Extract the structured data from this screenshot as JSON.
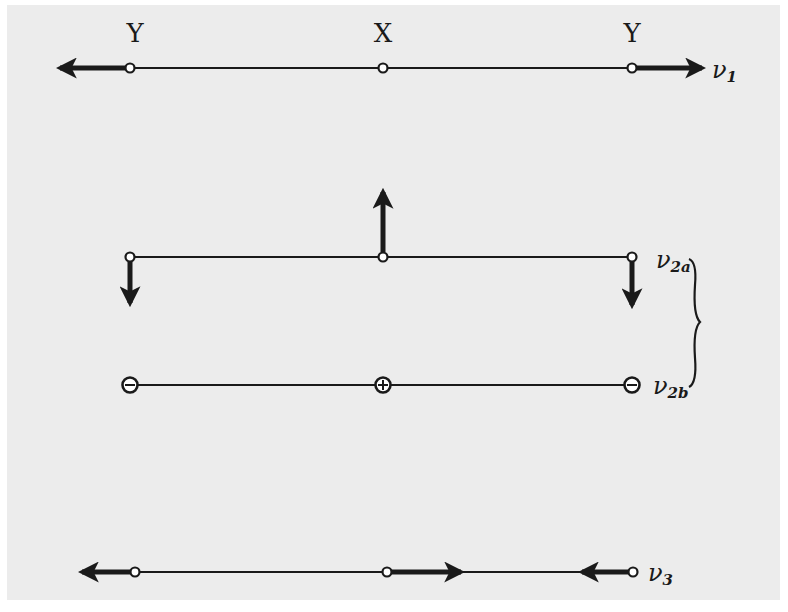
{
  "figure": {
    "atom_labels": [
      "Y",
      "X",
      "Y"
    ],
    "modes": [
      {
        "id": "v1",
        "symbol": "ν",
        "subscript": "1",
        "description": "symmetric stretch: outer Y atoms move outward along axis, X stationary"
      },
      {
        "id": "v2a",
        "symbol": "ν",
        "subscript": "2a",
        "description": "bending in plane: X moves up, both Y move down"
      },
      {
        "id": "v2b",
        "symbol": "ν",
        "subscript": "2b",
        "description": "bending perpendicular to plane: X marked +, both Y marked −"
      },
      {
        "id": "v3",
        "symbol": "ν",
        "subscript": "3",
        "description": "asymmetric stretch: left Y moves left, X moves right, right Y moves left"
      }
    ],
    "bracket": {
      "groups": [
        "v2a",
        "v2b"
      ],
      "meaning": "degenerate pair"
    },
    "v2b_signs": [
      "−",
      "+",
      "−"
    ],
    "colors": {
      "background": "#ececec",
      "ink": "#1a1a1a"
    }
  }
}
